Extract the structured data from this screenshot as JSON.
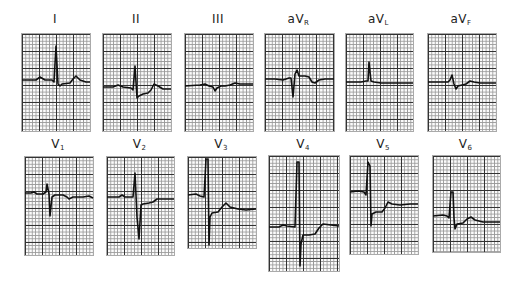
{
  "leads": [
    {
      "id": "I",
      "label": "I",
      "sub": "",
      "box": [
        21,
        33,
        68,
        97
      ],
      "path": "M0,46 L14,46 L18,43 L23,46 L30,46 L32,48 L34,12 L36,50 L38,52 L40,50 L48,49 L51,45 L54,42 L58,46 L64,48 L68,48"
    },
    {
      "id": "II",
      "label": "II",
      "sub": "",
      "box": [
        102,
        33,
        68,
        97
      ],
      "path": "M0,53 L10,53 L15,51 L20,53 L28,54 L30,56 L32,32 L34,64 L36,62 L40,60 L45,59 L48,56 L51,50 L55,52 L60,55 L68,55"
    },
    {
      "id": "III",
      "label": "III",
      "sub": "",
      "box": [
        184,
        33,
        68,
        97
      ],
      "path": "M0,52 L15,51 L20,50 L24,52 L28,53 L30,57 L32,54 L36,52 L40,52 L45,51 L50,49 L55,50 L68,50"
    },
    {
      "id": "aVR",
      "label": "aV",
      "sub": "R",
      "box": [
        264,
        33,
        69,
        97
      ],
      "path": "M0,45 L10,45 L18,46 L24,44 L26,44 L28,63 L30,40 L32,36 L34,42 L40,42 L44,43 L47,48 L50,49 L54,46 L60,45 L69,45"
    },
    {
      "id": "aVL",
      "label": "aV",
      "sub": "L",
      "box": [
        345,
        33,
        67,
        97
      ],
      "path": "M0,48 L15,48 L20,47 L22,47 L23,28 L25,47 L28,48 L35,49 L45,49 L55,49 L67,49"
    },
    {
      "id": "aVF",
      "label": "aV",
      "sub": "F",
      "box": [
        427,
        33,
        68,
        97
      ],
      "path": "M0,48 L20,48 L22,46 L24,41 L26,50 L28,55 L30,52 L38,50 L42,47 L46,48 L52,49 L60,49 L68,49"
    },
    {
      "id": "V1",
      "label": "V",
      "sub": "1",
      "box": [
        24,
        156,
        68,
        98
      ],
      "path": "M0,36 L6,36 L9,35 L12,37 L18,37 L21,35 L22,27 L24,37 L25,59 L27,40 L30,38 L38,38 L42,40 L44,42 L48,40 L58,40 L64,39 L68,41"
    },
    {
      "id": "V2",
      "label": "V",
      "sub": "2",
      "box": [
        106,
        156,
        67,
        98
      ],
      "path": "M0,40 L12,40 L15,38 L18,40 L26,40 L28,16 L30,60 L32,82 L34,48 L36,47 L42,46 L46,45 L50,42 L56,42 L67,42"
    },
    {
      "id": "V3",
      "label": "V",
      "sub": "3",
      "box": [
        187,
        156,
        68,
        91
      ],
      "path": "M0,38 L8,37 L12,39 L16,40 L18,2 L20,2 L21,88 L22,60 L24,56 L30,55 L34,50 L38,46 L42,50 L50,52 L58,53 L68,52"
    },
    {
      "id": "V4",
      "label": "V",
      "sub": "4",
      "box": [
        268,
        155,
        70,
        115
      ],
      "path": "M0,71 L10,71 L14,69 L18,70 L26,71 L28,6 L30,6 L31,110 L32,88 L34,79 L40,79 L46,78 L50,72 L54,68 L62,69 L70,70"
    },
    {
      "id": "V5",
      "label": "V",
      "sub": "5",
      "box": [
        349,
        155,
        68,
        98
      ],
      "path": "M0,36 L8,35 L14,36 L16,39 L18,6 L20,10 L21,70 L22,58 L26,56 L32,56 L35,52 L38,46 L42,48 L50,49 L60,48 L68,48"
    },
    {
      "id": "V6",
      "label": "V",
      "sub": "6",
      "box": [
        432,
        155,
        67,
        96
      ],
      "path": "M0,60 L10,59 L14,60 L16,62 L18,36 L20,36 L21,62 L22,73 L24,68 L30,67 L34,63 L38,61 L42,64 L50,66 L67,66"
    }
  ],
  "labels_y": {
    "row1": 12,
    "row2": 137
  }
}
